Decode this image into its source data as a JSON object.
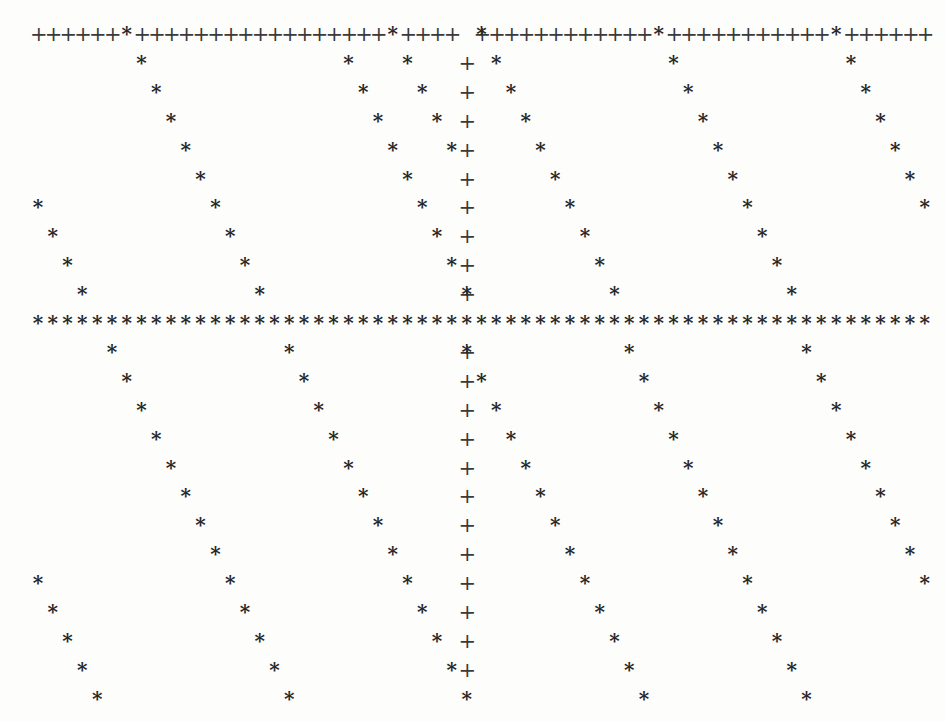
{
  "figure": {
    "kind": "character-grid-plot",
    "width": 945,
    "height": 722,
    "background_color": "#fdfdfc",
    "ink_color": "#2b2b2b"
  },
  "glyph_set": {
    "plus": "+",
    "star": "*"
  },
  "grid": {
    "columns": 61,
    "rows": 24,
    "origin_x": 38,
    "origin_y": 24,
    "col_step": 14.78,
    "row_step": 28.9
  },
  "chart_data": {
    "type": "scatter",
    "title": "",
    "subtitle": "",
    "xlabel": "",
    "ylabel": "",
    "xlim": [
      0,
      60
    ],
    "ylim": [
      0,
      23
    ],
    "grid": false,
    "legend": null,
    "axis_ticks_visible": false,
    "tick_labels_visible": false,
    "series": [
      {
        "name": "plus",
        "marker": "+",
        "color": "#3a3a3a",
        "point_count": 84,
        "components": [
          {
            "shape": "horizontal-line",
            "row": 0,
            "col_start": 0,
            "col_end": 60,
            "note": "continuous row of + marks spanning the full plot width, interrupted where star marks coincide"
          },
          {
            "shape": "vertical-line",
            "col": 29,
            "row_start": 0,
            "row_end": 23,
            "note": "continuous column of + marks, interrupted at row 10 by the star horizontal line"
          }
        ],
        "points": [
          [
            0,
            0
          ],
          [
            1,
            0
          ],
          [
            2,
            0
          ],
          [
            3,
            0
          ],
          [
            4,
            0
          ],
          [
            5,
            0
          ],
          [
            7,
            0
          ],
          [
            8,
            0
          ],
          [
            9,
            0
          ],
          [
            10,
            0
          ],
          [
            11,
            0
          ],
          [
            12,
            0
          ],
          [
            13,
            0
          ],
          [
            14,
            0
          ],
          [
            15,
            0
          ],
          [
            16,
            0
          ],
          [
            17,
            0
          ],
          [
            18,
            0
          ],
          [
            19,
            0
          ],
          [
            20,
            0
          ],
          [
            21,
            0
          ],
          [
            22,
            0
          ],
          [
            23,
            0
          ],
          [
            25,
            0
          ],
          [
            26,
            0
          ],
          [
            27,
            0
          ],
          [
            28,
            0
          ],
          [
            30,
            0
          ],
          [
            31,
            0
          ],
          [
            32,
            0
          ],
          [
            33,
            0
          ],
          [
            34,
            0
          ],
          [
            35,
            0
          ],
          [
            36,
            0
          ],
          [
            37,
            0
          ],
          [
            38,
            0
          ],
          [
            39,
            0
          ],
          [
            40,
            0
          ],
          [
            41,
            0
          ],
          [
            43,
            0
          ],
          [
            44,
            0
          ],
          [
            45,
            0
          ],
          [
            46,
            0
          ],
          [
            47,
            0
          ],
          [
            48,
            0
          ],
          [
            49,
            0
          ],
          [
            50,
            0
          ],
          [
            51,
            0
          ],
          [
            52,
            0
          ],
          [
            53,
            0
          ],
          [
            55,
            0
          ],
          [
            56,
            0
          ],
          [
            57,
            0
          ],
          [
            58,
            0
          ],
          [
            59,
            0
          ],
          [
            60,
            0
          ],
          [
            29,
            1
          ],
          [
            29,
            2
          ],
          [
            29,
            3
          ],
          [
            29,
            4
          ],
          [
            29,
            5
          ],
          [
            29,
            6
          ],
          [
            29,
            7
          ],
          [
            29,
            8
          ],
          [
            29,
            9
          ],
          [
            29,
            11
          ],
          [
            29,
            12
          ],
          [
            29,
            13
          ],
          [
            29,
            14
          ],
          [
            29,
            15
          ],
          [
            29,
            16
          ],
          [
            29,
            17
          ],
          [
            29,
            18
          ],
          [
            29,
            19
          ],
          [
            29,
            20
          ],
          [
            29,
            21
          ],
          [
            29,
            22
          ]
        ]
      },
      {
        "name": "star",
        "marker": "*",
        "color": "#272727",
        "point_count": 194,
        "components": [
          {
            "shape": "horizontal-line",
            "row": 10,
            "col_start": 0,
            "col_end": 60,
            "note": "continuous row of * marks spanning the full plot width"
          },
          {
            "shape": "diagonal-family",
            "slope_cols_per_row": 1,
            "period_cols": 18,
            "anchor_cols_at_row0": [
              6,
              24,
              42,
              60
            ],
            "wraps_at_edges": true,
            "note": "descending diagonals, one character right per row down; also restart below row 10"
          }
        ],
        "points": [
          [
            6,
            0
          ],
          [
            24,
            0
          ],
          [
            30,
            0
          ],
          [
            42,
            0
          ],
          [
            54,
            0
          ],
          [
            7,
            1
          ],
          [
            21,
            1
          ],
          [
            25,
            1
          ],
          [
            31,
            1
          ],
          [
            43,
            1
          ],
          [
            55,
            1
          ],
          [
            8,
            2
          ],
          [
            22,
            2
          ],
          [
            26,
            2
          ],
          [
            32,
            2
          ],
          [
            44,
            2
          ],
          [
            56,
            2
          ],
          [
            9,
            3
          ],
          [
            23,
            3
          ],
          [
            27,
            3
          ],
          [
            33,
            3
          ],
          [
            45,
            3
          ],
          [
            57,
            3
          ],
          [
            10,
            4
          ],
          [
            24,
            4
          ],
          [
            28,
            4
          ],
          [
            34,
            4
          ],
          [
            46,
            4
          ],
          [
            58,
            4
          ],
          [
            11,
            5
          ],
          [
            25,
            5
          ],
          [
            35,
            5
          ],
          [
            47,
            5
          ],
          [
            59,
            5
          ],
          [
            0,
            6
          ],
          [
            12,
            6
          ],
          [
            26,
            6
          ],
          [
            36,
            6
          ],
          [
            48,
            6
          ],
          [
            60,
            6
          ],
          [
            1,
            7
          ],
          [
            13,
            7
          ],
          [
            27,
            7
          ],
          [
            37,
            7
          ],
          [
            49,
            7
          ],
          [
            2,
            8
          ],
          [
            14,
            8
          ],
          [
            28,
            8
          ],
          [
            38,
            8
          ],
          [
            50,
            8
          ],
          [
            3,
            9
          ],
          [
            15,
            9
          ],
          [
            29,
            9
          ],
          [
            39,
            9
          ],
          [
            51,
            9
          ],
          [
            0,
            10
          ],
          [
            1,
            10
          ],
          [
            2,
            10
          ],
          [
            3,
            10
          ],
          [
            4,
            10
          ],
          [
            5,
            10
          ],
          [
            6,
            10
          ],
          [
            7,
            10
          ],
          [
            8,
            10
          ],
          [
            9,
            10
          ],
          [
            10,
            10
          ],
          [
            11,
            10
          ],
          [
            12,
            10
          ],
          [
            13,
            10
          ],
          [
            14,
            10
          ],
          [
            15,
            10
          ],
          [
            16,
            10
          ],
          [
            17,
            10
          ],
          [
            18,
            10
          ],
          [
            19,
            10
          ],
          [
            20,
            10
          ],
          [
            21,
            10
          ],
          [
            22,
            10
          ],
          [
            23,
            10
          ],
          [
            24,
            10
          ],
          [
            25,
            10
          ],
          [
            26,
            10
          ],
          [
            27,
            10
          ],
          [
            28,
            10
          ],
          [
            29,
            10
          ],
          [
            30,
            10
          ],
          [
            31,
            10
          ],
          [
            32,
            10
          ],
          [
            33,
            10
          ],
          [
            34,
            10
          ],
          [
            35,
            10
          ],
          [
            36,
            10
          ],
          [
            37,
            10
          ],
          [
            38,
            10
          ],
          [
            39,
            10
          ],
          [
            40,
            10
          ],
          [
            41,
            10
          ],
          [
            42,
            10
          ],
          [
            43,
            10
          ],
          [
            44,
            10
          ],
          [
            45,
            10
          ],
          [
            46,
            10
          ],
          [
            47,
            10
          ],
          [
            48,
            10
          ],
          [
            49,
            10
          ],
          [
            50,
            10
          ],
          [
            51,
            10
          ],
          [
            52,
            10
          ],
          [
            53,
            10
          ],
          [
            54,
            10
          ],
          [
            55,
            10
          ],
          [
            56,
            10
          ],
          [
            57,
            10
          ],
          [
            58,
            10
          ],
          [
            59,
            10
          ],
          [
            60,
            10
          ],
          [
            5,
            11
          ],
          [
            17,
            11
          ],
          [
            29,
            11
          ],
          [
            40,
            11
          ],
          [
            52,
            11
          ],
          [
            6,
            12
          ],
          [
            18,
            12
          ],
          [
            30,
            12
          ],
          [
            41,
            12
          ],
          [
            53,
            12
          ],
          [
            7,
            13
          ],
          [
            19,
            13
          ],
          [
            31,
            13
          ],
          [
            42,
            13
          ],
          [
            54,
            13
          ],
          [
            8,
            14
          ],
          [
            20,
            14
          ],
          [
            32,
            14
          ],
          [
            43,
            14
          ],
          [
            55,
            14
          ],
          [
            9,
            15
          ],
          [
            21,
            15
          ],
          [
            33,
            15
          ],
          [
            44,
            15
          ],
          [
            56,
            15
          ],
          [
            10,
            16
          ],
          [
            22,
            16
          ],
          [
            34,
            16
          ],
          [
            45,
            16
          ],
          [
            57,
            16
          ],
          [
            11,
            17
          ],
          [
            23,
            17
          ],
          [
            35,
            17
          ],
          [
            46,
            17
          ],
          [
            58,
            17
          ],
          [
            12,
            18
          ],
          [
            24,
            18
          ],
          [
            36,
            18
          ],
          [
            47,
            18
          ],
          [
            59,
            18
          ],
          [
            0,
            19
          ],
          [
            13,
            19
          ],
          [
            25,
            19
          ],
          [
            37,
            19
          ],
          [
            48,
            19
          ],
          [
            60,
            19
          ],
          [
            1,
            20
          ],
          [
            14,
            20
          ],
          [
            26,
            20
          ],
          [
            38,
            20
          ],
          [
            49,
            20
          ],
          [
            2,
            21
          ],
          [
            15,
            21
          ],
          [
            27,
            21
          ],
          [
            39,
            21
          ],
          [
            50,
            21
          ],
          [
            3,
            22
          ],
          [
            16,
            22
          ],
          [
            28,
            22
          ],
          [
            40,
            22
          ],
          [
            51,
            22
          ],
          [
            4,
            23
          ],
          [
            17,
            23
          ],
          [
            29,
            23
          ],
          [
            41,
            23
          ],
          [
            52,
            23
          ]
        ]
      }
    ]
  }
}
